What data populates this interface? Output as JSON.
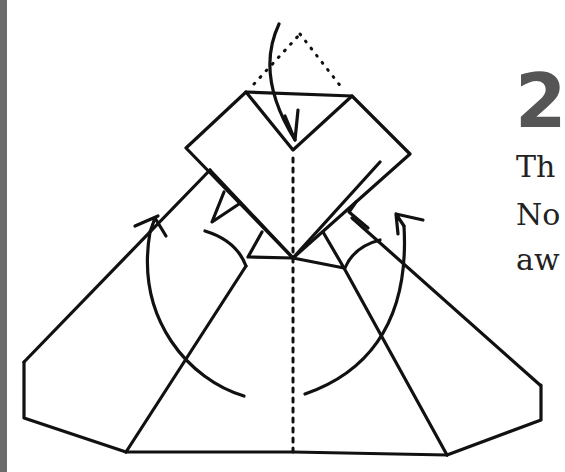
{
  "diagram": {
    "step_number": "2",
    "instruction_lines": [
      "Th",
      "No",
      "aw"
    ],
    "colors": {
      "line": "#111111",
      "step_number": "#555555",
      "border": "#6b6b6b",
      "background": "#ffffff"
    },
    "elements": {
      "top_flap": "rhombus flap folded down along dotted line",
      "fold_arrow_top": "arrow folding top triangle down",
      "fold_arrow_left": "arrow folding left wing up",
      "fold_arrow_right": "arrow folding right wing up",
      "center_crease": "dotted vertical center crease"
    }
  }
}
